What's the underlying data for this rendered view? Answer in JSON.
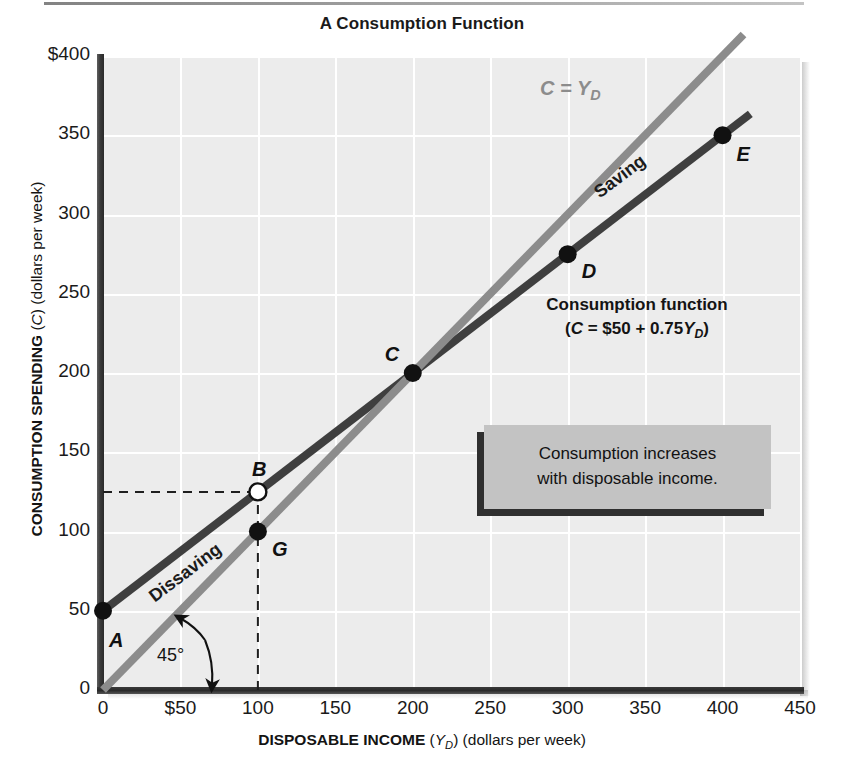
{
  "chart_data": {
    "type": "line",
    "title": "A Consumption Function",
    "xlabel_main": "DISPOSABLE INCOME",
    "xlabel_symbol": "YD",
    "xlabel_units": "(dollars per week)",
    "ylabel_main": "CONSUMPTION SPENDING",
    "ylabel_symbol": "C",
    "ylabel_units": "(dollars per week)",
    "xlim": [
      0,
      450
    ],
    "ylim": [
      0,
      400
    ],
    "xticks": [
      "0",
      "$50",
      "100",
      "150",
      "200",
      "250",
      "300",
      "350",
      "400",
      "450"
    ],
    "xtick_values": [
      0,
      50,
      100,
      150,
      200,
      250,
      300,
      350,
      400,
      450
    ],
    "yticks": [
      "0",
      "50",
      "100",
      "150",
      "200",
      "250",
      "300",
      "350",
      "$400"
    ],
    "ytick_values": [
      0,
      50,
      100,
      150,
      200,
      250,
      300,
      350,
      400
    ],
    "grid": true,
    "legend_position": "inline-annotations",
    "series": [
      {
        "name": "Consumption function",
        "equation": "C = $50 + 0.75YD",
        "color": "#3f3f3f",
        "x": [
          0,
          100,
          200,
          300,
          400
        ],
        "values": [
          50,
          125,
          200,
          275,
          350
        ],
        "intercept": 50,
        "slope": 0.75
      },
      {
        "name": "C = YD",
        "equation": "C = YD",
        "color": "#8c8c8c",
        "x": [
          0,
          400
        ],
        "values": [
          0,
          400
        ],
        "intercept": 0,
        "slope": 1
      }
    ],
    "points": [
      {
        "label": "A",
        "x": 0,
        "y": 50,
        "filled": true,
        "label_dx": 6,
        "label_dy": 18
      },
      {
        "label": "B",
        "x": 100,
        "y": 125,
        "filled": false,
        "label_dx": -6,
        "label_dy": -34
      },
      {
        "label": "C",
        "x": 200,
        "y": 200,
        "filled": true,
        "label_dx": -28,
        "label_dy": -30
      },
      {
        "label": "D",
        "x": 300,
        "y": 275,
        "filled": true,
        "label_dx": 14,
        "label_dy": 6
      },
      {
        "label": "E",
        "x": 400,
        "y": 350,
        "filled": true,
        "label_dx": 14,
        "label_dy": 8
      },
      {
        "label": "G",
        "x": 100,
        "y": 100,
        "filled": true,
        "label_dx": 14,
        "label_dy": 6
      }
    ],
    "annotations": [
      {
        "name": "saving",
        "text": "Saving"
      },
      {
        "name": "dissaving",
        "text": "Dissaving"
      },
      {
        "name": "angle",
        "text": "45°"
      },
      {
        "name": "c-equals-yd",
        "text": "C = YD"
      }
    ],
    "guide_lines": [
      {
        "name": "b-horizontal",
        "from": [
          0,
          125
        ],
        "to": [
          100,
          125
        ],
        "style": "dashed"
      },
      {
        "name": "b-vertical",
        "from": [
          100,
          0
        ],
        "to": [
          100,
          125
        ],
        "style": "dashed"
      }
    ]
  },
  "consumption_function_label": {
    "line1": "Consumption function",
    "line2_prefix": "(",
    "line2_c": "C",
    "line2_mid": " = $50 + 0.75",
    "line2_y": "Y",
    "line2_sub": "D",
    "line2_suffix": ")"
  },
  "callout": {
    "line1": "Consumption increases",
    "line2": "with disposable income."
  },
  "colors": {
    "plot_background": "#ececec",
    "gridline": "#ffffff",
    "consumption_line": "#3f3f3f",
    "reference_line": "#8c8c8c",
    "axis": "#2a2a2a",
    "callout_fill": "#c3c3c3",
    "callout_shadow": "#2f2f2f",
    "text": "#141414"
  }
}
